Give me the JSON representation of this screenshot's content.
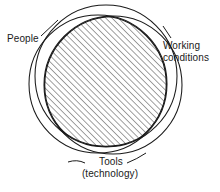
{
  "figure": {
    "type": "venn-diagram-3-circle",
    "background_color": "#ffffff",
    "stroke_color": "#1a1a1a",
    "hatch_color": "#4d4d4d",
    "labels": {
      "people": "People",
      "working_conditions_line1": "Working",
      "working_conditions_line2": "conditions",
      "tools_line1": "Tools",
      "tools_line2": "(technology)"
    },
    "sets": [
      {
        "name": "People",
        "label": "People"
      },
      {
        "name": "Working conditions",
        "label": "Working conditions"
      },
      {
        "name": "Tools (technology)",
        "label": "Tools (technology)"
      }
    ],
    "intersection": {
      "fill": "diagonal-hatch",
      "description": "common overlap of all three circles is hatched"
    }
  }
}
